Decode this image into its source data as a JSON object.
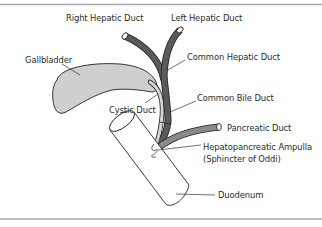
{
  "diagram": {
    "labels": {
      "right_hepatic_duct": "Right Hepatic Duct",
      "left_hepatic_duct": "Left Hepatic Duct",
      "gallbladder": "Gallbladder",
      "common_hepatic_duct": "Common Hepatic Duct",
      "cystic_duct": "Cystic Duct",
      "common_bile_duct": "Common Bile Duct",
      "pancreatic_duct": "Pancreatic Duct",
      "ampulla_line1": "Hepatopancreatic Ampulla",
      "ampulla_line2": "(Sphincter of Oddi)",
      "duodenum": "Duodenum"
    },
    "colors": {
      "border": "#a8a8a8",
      "hepatic_duct": "#5a5a5a",
      "cystic_duct": "#d4d4d4",
      "pancreatic_duct": "#8a8a8a",
      "gallbladder_fill": "#cfcfcf",
      "outline": "#222222",
      "leader_line": "#333333"
    }
  }
}
